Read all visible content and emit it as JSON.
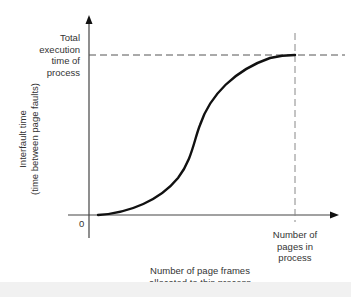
{
  "diagram": {
    "y_axis_label": [
      "Interfault time",
      "(time between page faults)"
    ],
    "x_axis_label": [
      "Number of page frames",
      "allocated to this process"
    ],
    "origin_label": "0",
    "y_marker_label": [
      "Total",
      "execution",
      "time of",
      "process"
    ],
    "x_marker_label": [
      "Number of",
      "pages in",
      "process"
    ],
    "curve": {
      "type": "sigmoid",
      "description": "Interfault time rises slowly, then steeply, then saturates at total execution time when frames equal number of pages"
    },
    "colors": {
      "curve": "#111111",
      "axes": "#444444",
      "dashed": "#555555"
    }
  }
}
